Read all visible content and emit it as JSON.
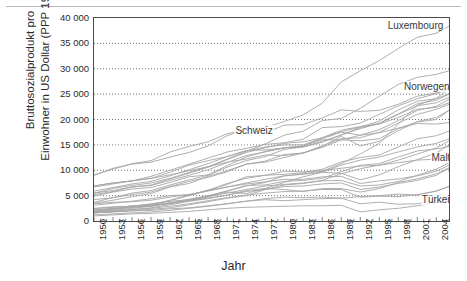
{
  "chart_data": {
    "type": "line",
    "title": "",
    "subtitle": "",
    "xlabel": "Jahr",
    "ylabel": "Bruttosozialprodukt pro Einwohner in US Dollar (PPP 1990)",
    "ylabel_line1": "Bruttosozialprodukt pro",
    "ylabel_line2": "Einwohner in US Dollar (PPP 1990)",
    "xlim": [
      1950,
      2006
    ],
    "ylim": [
      0,
      40000
    ],
    "grid": "horizontal-dotted",
    "legend_position": "inline-annotations",
    "line_color": "#a6a6a6",
    "frame_color": "#4a4a4a",
    "xticks": [
      "1950",
      "1953",
      "1956",
      "1959",
      "1962",
      "1965",
      "1968",
      "1971",
      "1974",
      "1977",
      "1980",
      "1983",
      "1986",
      "1989",
      "1992",
      "1995",
      "1998",
      "2001",
      "2004"
    ],
    "xtick_values": [
      1950,
      1953,
      1956,
      1959,
      1962,
      1965,
      1968,
      1971,
      1974,
      1977,
      1980,
      1983,
      1986,
      1989,
      1992,
      1995,
      1998,
      2001,
      2004
    ],
    "yticks": [
      "0",
      "5 000",
      "10 000",
      "15 000",
      "20 000",
      "25 000",
      "30 000",
      "35 000",
      "40 000"
    ],
    "ytick_values": [
      0,
      5000,
      10000,
      15000,
      20000,
      25000,
      30000,
      35000,
      40000
    ],
    "annotations": [
      {
        "name": "Luxembourg",
        "label": "Luxembourg",
        "x": 1998,
        "y": 38500
      },
      {
        "name": "Norwegen",
        "label": "Norwegen",
        "x": 1999,
        "y": 26500
      },
      {
        "name": "Schweiz",
        "label": "Schweiz",
        "x": 1972,
        "y": 17800
      },
      {
        "name": "Malta",
        "label": "Malta",
        "x": 2000,
        "y": 12400
      },
      {
        "name": "Tuerkei",
        "label": "Türkei",
        "x": 1999,
        "y": 4200
      }
    ],
    "x": [
      1950,
      1953,
      1956,
      1959,
      1962,
      1965,
      1968,
      1971,
      1974,
      1977,
      1980,
      1983,
      1986,
      1989,
      1992,
      1995,
      1998,
      2001,
      2004,
      2006
    ],
    "series": [
      {
        "name": "Luxembourg",
        "values": [
          9000,
          10400,
          11200,
          11600,
          12600,
          13500,
          14800,
          16800,
          18200,
          18400,
          19600,
          20900,
          23200,
          27400,
          29600,
          31600,
          34000,
          36200,
          37000,
          38400
        ]
      },
      {
        "name": "Norwegen",
        "values": [
          5500,
          6400,
          7000,
          7500,
          8400,
          9600,
          10700,
          12200,
          13700,
          15200,
          16900,
          17700,
          19800,
          20200,
          22200,
          24600,
          26900,
          28300,
          28900,
          29600
        ]
      },
      {
        "name": "Schweiz",
        "values": [
          9100,
          10200,
          11300,
          11900,
          13600,
          14700,
          15600,
          17200,
          17900,
          17300,
          18900,
          19000,
          20300,
          21900,
          21600,
          21800,
          23000,
          24600,
          25200,
          26300
        ]
      },
      {
        "name": "Daenemark",
        "values": [
          6900,
          7500,
          7900,
          8800,
          10000,
          11200,
          12400,
          13600,
          14300,
          15100,
          15400,
          16100,
          18400,
          18600,
          19300,
          21000,
          22700,
          24100,
          25100,
          26000
        ]
      },
      {
        "name": "Niederlande",
        "values": [
          5900,
          6600,
          7300,
          7800,
          8900,
          10100,
          11300,
          12700,
          13800,
          14600,
          15000,
          15000,
          16400,
          17600,
          18500,
          19700,
          21900,
          23600,
          24100,
          25100
        ]
      },
      {
        "name": "Oesterreich",
        "values": [
          3700,
          4600,
          5500,
          6000,
          7100,
          8100,
          9000,
          10600,
          11900,
          12700,
          14100,
          14600,
          15700,
          16900,
          18400,
          19300,
          21100,
          23100,
          23800,
          25000
        ]
      },
      {
        "name": "Belgien",
        "values": [
          5500,
          6000,
          6700,
          7000,
          8000,
          9000,
          10100,
          11500,
          12900,
          13600,
          14400,
          14600,
          15500,
          17000,
          18200,
          19200,
          21000,
          22700,
          23300,
          24400
        ]
      },
      {
        "name": "Schweden",
        "values": [
          6700,
          7300,
          7900,
          8400,
          9600,
          11000,
          11900,
          12700,
          13900,
          14000,
          14400,
          14800,
          16200,
          17500,
          16900,
          18000,
          19800,
          21800,
          22600,
          24000
        ]
      },
      {
        "name": "Frankreich",
        "values": [
          5200,
          5800,
          6700,
          7100,
          8300,
          9400,
          10600,
          12100,
          13500,
          14400,
          15300,
          15600,
          16400,
          17900,
          18600,
          19100,
          20400,
          22000,
          22400,
          23300
        ]
      },
      {
        "name": "Island",
        "values": [
          4900,
          5700,
          6300,
          6600,
          7600,
          8700,
          9100,
          10900,
          12600,
          13700,
          14400,
          14800,
          16000,
          16000,
          15800,
          16200,
          18200,
          19500,
          20000,
          21800
        ]
      },
      {
        "name": "Grossbritannien",
        "values": [
          6900,
          7500,
          7900,
          8400,
          9100,
          9900,
          10700,
          11600,
          12200,
          13000,
          12900,
          13400,
          14800,
          16200,
          16400,
          17500,
          19300,
          21000,
          22000,
          23000
        ]
      },
      {
        "name": "Finnland",
        "values": [
          4200,
          4600,
          5200,
          5700,
          6800,
          7800,
          8600,
          9700,
          11200,
          11600,
          12500,
          13400,
          14700,
          16700,
          14800,
          15700,
          17800,
          19600,
          20400,
          21800
        ]
      },
      {
        "name": "Italien",
        "values": [
          3500,
          4100,
          4800,
          5400,
          6700,
          7400,
          8800,
          9900,
          11200,
          11800,
          13100,
          13400,
          14500,
          16000,
          16900,
          17400,
          18300,
          19200,
          19100,
          19400
        ]
      },
      {
        "name": "Irland",
        "values": [
          3400,
          3700,
          3800,
          4100,
          4700,
          5200,
          5900,
          6700,
          7500,
          8200,
          8900,
          9300,
          9800,
          11300,
          13200,
          15300,
          19100,
          22800,
          24200,
          26000
        ]
      },
      {
        "name": "Spanien",
        "values": [
          2200,
          2500,
          3000,
          3200,
          4100,
          5100,
          6100,
          7200,
          8700,
          9000,
          9200,
          9500,
          10200,
          11600,
          12500,
          13000,
          14600,
          16200,
          16800,
          17700
        ]
      },
      {
        "name": "Griechenland",
        "values": [
          1900,
          2300,
          2900,
          3200,
          4000,
          5000,
          6000,
          7400,
          8400,
          9000,
          9800,
          9700,
          9900,
          10400,
          10800,
          11000,
          12000,
          13200,
          14400,
          15800
        ]
      },
      {
        "name": "Zypern",
        "values": [
          2100,
          2400,
          2700,
          2900,
          3400,
          4100,
          4700,
          5700,
          5400,
          6400,
          7600,
          8700,
          9600,
          11000,
          12000,
          12600,
          13600,
          14600,
          15300,
          16200
        ]
      },
      {
        "name": "Portugal",
        "values": [
          1700,
          2000,
          2300,
          2600,
          3200,
          3900,
          4900,
          5900,
          7000,
          7100,
          7800,
          8000,
          8400,
          9700,
          11000,
          11300,
          12600,
          13800,
          14200,
          14700
        ]
      },
      {
        "name": "Slowenien",
        "values": [
          1800,
          2100,
          2500,
          2900,
          3600,
          4300,
          5000,
          5900,
          6900,
          7600,
          8900,
          9200,
          9600,
          9400,
          8100,
          9100,
          10700,
          12100,
          13400,
          15000
        ]
      },
      {
        "name": "Tschechien",
        "values": [
          3100,
          3500,
          3900,
          4400,
          5000,
          5200,
          6000,
          6700,
          7300,
          7700,
          8200,
          8200,
          8700,
          8800,
          7400,
          7900,
          8300,
          8900,
          9800,
          11000
        ]
      },
      {
        "name": "Ungarn",
        "values": [
          2500,
          2800,
          2900,
          3400,
          3900,
          4200,
          4900,
          5500,
          6200,
          6900,
          7200,
          7500,
          7900,
          8000,
          6900,
          7100,
          7800,
          9000,
          10200,
          11500
        ]
      },
      {
        "name": "Malta",
        "values": [
          1600,
          1800,
          2000,
          2300,
          2600,
          3200,
          3800,
          4500,
          5000,
          6200,
          7100,
          7400,
          8000,
          9300,
          10300,
          11000,
          11500,
          12000,
          12200,
          12600
        ]
      },
      {
        "name": "Polen",
        "values": [
          2400,
          2700,
          2900,
          3200,
          3500,
          3900,
          4400,
          5100,
          6000,
          6400,
          6200,
          5800,
          6400,
          6400,
          5700,
          6400,
          7600,
          8300,
          9300,
          10500
        ]
      },
      {
        "name": "Slowakei",
        "values": [
          2000,
          2300,
          2700,
          3100,
          3600,
          4000,
          4500,
          5100,
          5800,
          6200,
          6800,
          6900,
          7300,
          7500,
          6200,
          6700,
          7400,
          8000,
          9000,
          10400
        ]
      },
      {
        "name": "Bulgarien",
        "values": [
          1600,
          1900,
          2200,
          2500,
          2900,
          3400,
          4000,
          4600,
          5100,
          5500,
          5800,
          5900,
          6200,
          6200,
          4700,
          4900,
          4800,
          5200,
          5900,
          6800
        ]
      },
      {
        "name": "Rumaenien",
        "values": [
          1200,
          1400,
          1600,
          1800,
          2100,
          2500,
          2900,
          3400,
          3900,
          4400,
          4700,
          4600,
          4700,
          4500,
          3400,
          3700,
          3300,
          3400,
          4100,
          5000
        ]
      },
      {
        "name": "Tuerkei",
        "values": [
          1600,
          1800,
          2000,
          2100,
          2400,
          2600,
          3000,
          3400,
          3900,
          4200,
          4000,
          4200,
          4400,
          4500,
          4800,
          5000,
          5300,
          5100,
          5900,
          6800
        ]
      },
      {
        "name": "Albanien",
        "values": [
          1000,
          1200,
          1400,
          1500,
          1700,
          1900,
          2200,
          2500,
          2700,
          2800,
          2900,
          3000,
          3000,
          3100,
          1800,
          2200,
          2500,
          3000,
          3600,
          4300
        ]
      }
    ]
  }
}
